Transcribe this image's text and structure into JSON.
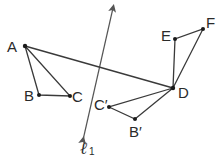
{
  "diagram": {
    "title": "",
    "line": {
      "label": "ℓ",
      "subscript": "1",
      "start": [
        83,
        140
      ],
      "end": [
        113,
        8
      ]
    },
    "points": {
      "A": {
        "label": "A",
        "x": 25,
        "y": 46
      },
      "B": {
        "label": "B",
        "x": 39,
        "y": 95
      },
      "C": {
        "label": "C",
        "x": 70,
        "y": 96
      },
      "D": {
        "label": "D",
        "x": 173,
        "y": 88
      },
      "E": {
        "label": "E",
        "x": 175,
        "y": 39
      },
      "F": {
        "label": "F",
        "x": 203,
        "y": 29
      },
      "C_prime": {
        "label": "C′",
        "x": 109,
        "y": 107
      },
      "B_prime": {
        "label": "B′",
        "x": 135,
        "y": 119
      }
    },
    "triangles": [
      {
        "name": "ABC",
        "vertices": [
          "A",
          "B",
          "C"
        ]
      },
      {
        "name": "C'B'D",
        "vertices": [
          "C_prime",
          "B_prime",
          "D"
        ]
      },
      {
        "name": "DEF",
        "vertices": [
          "D",
          "E",
          "F"
        ]
      }
    ],
    "extra_segments": [
      {
        "from": "A",
        "to": "D"
      }
    ],
    "colors": {
      "stroke": "#3a3a3a",
      "text": "#2a2a2a",
      "background": "#ffffff"
    }
  }
}
